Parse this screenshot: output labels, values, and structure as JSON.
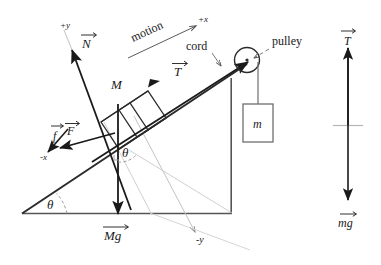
{
  "diagram": {
    "incline": {
      "angle_label": "θ",
      "angle_label_upper": "θ",
      "block_label": "M",
      "hanging_mass_label": "m"
    },
    "labels": {
      "normal_force": "N",
      "tension_incline": "T",
      "applied_force": "F",
      "friction": "f",
      "weight_block": "Mg",
      "motion": "motion",
      "cord": "cord",
      "pulley": "pulley",
      "axis_plus_x": "+x",
      "axis_plus_y": "+y",
      "axis_minus_x": "-x",
      "axis_minus_y": "-y"
    },
    "free_body": {
      "tension": "T",
      "weight": "mg"
    },
    "colors": {
      "ink": "#1a1a1a",
      "light_gray": "#b9b9b9",
      "mid_gray": "#8d8d8d",
      "background": "#ffffff"
    }
  }
}
